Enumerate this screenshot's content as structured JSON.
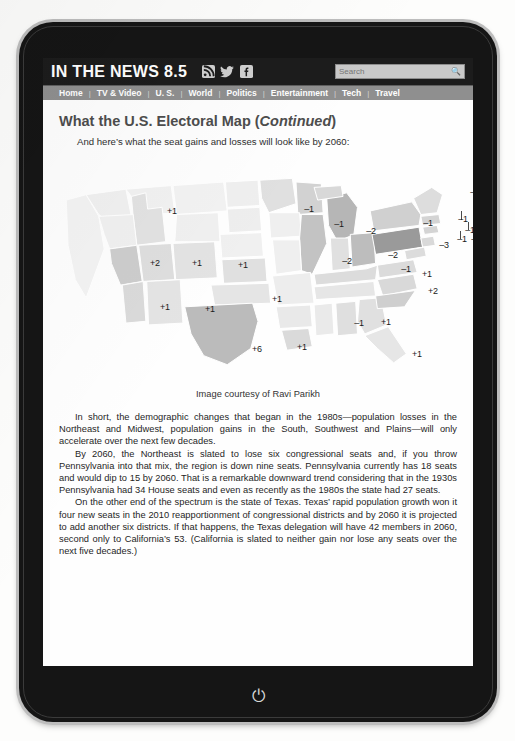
{
  "site": {
    "logo": "IN THE NEWS 8.5",
    "social": [
      {
        "name": "rss-icon",
        "label": "RSS"
      },
      {
        "name": "twitter-icon",
        "label": "Twitter"
      },
      {
        "name": "facebook-icon",
        "label": "Facebook"
      }
    ],
    "search": {
      "placeholder": "Search",
      "value": "",
      "icon": "search-icon"
    },
    "nav": [
      "Home",
      "TV & Video",
      "U. S.",
      "World",
      "Politics",
      "Entertainment",
      "Tech",
      "Travel"
    ],
    "nav_separator": "|"
  },
  "article": {
    "title_main": "What the U.S. Electoral Map (",
    "title_italic": "Continued",
    "title_close": ")",
    "intro": "And here’s what the seat gains and losses will look like by 2060:",
    "caption": "Image courtesy of Ravi Parikh",
    "paragraphs": [
      "In short, the demographic changes that began in the 1980s—population losses in the Northeast and Midwest, population gains in the South, Southwest and Plains—will only accelerate over the next few decades.",
      "By 2060, the Northeast is slated to lose six congressional seats and, if you throw Pennsylvania into that mix, the region is down nine seats. Pennsylvania currently has 18 seats and would dip to 15 by 2060. That is a remarkable downward trend considering that in the 1930s Pennsylvania had 34 House seats and even as recently as the 1980s the state had 27 seats.",
      "On the other end of the spectrum is the state of Texas. Texas’ rapid population growth won it four new seats in the 2010 reapportionment of congressional districts and by 2060 it is projected to add another six districts. If that happens, the Texas delegation will have 42 members in 2060, second only to California’s 53. (California is slated to neither gain nor lose any seats over the next five decades.)"
    ]
  },
  "device": {
    "home_button_icon": "power-icon"
  },
  "chart_data": {
    "type": "map",
    "unit": "congressional seats",
    "colors": {
      "gain_strong": "#b9b9b9",
      "gain_mild": "#d5d5d5",
      "neutral": "#ececec",
      "loss_mild": "#c4c4c4",
      "loss_strong": "#8f8f8f"
    },
    "labels": [
      {
        "state": "Idaho",
        "value": "+1",
        "x": 113,
        "y": 60
      },
      {
        "state": "Nevada",
        "value": "+2",
        "x": 96,
        "y": 112
      },
      {
        "state": "Utah",
        "value": "+1",
        "x": 138,
        "y": 112
      },
      {
        "state": "Colorado",
        "value": "+1",
        "x": 184,
        "y": 114
      },
      {
        "state": "Arizona",
        "value": "+1",
        "x": 106,
        "y": 156
      },
      {
        "state": "New Mexico",
        "value": "+1",
        "x": 151,
        "y": 158
      },
      {
        "state": "Kansas",
        "value": "+1",
        "x": 218,
        "y": 148
      },
      {
        "state": "Texas",
        "value": "+6",
        "x": 198,
        "y": 198
      },
      {
        "state": "Louisiana",
        "value": "+1",
        "x": 243,
        "y": 196
      },
      {
        "state": "Minnesota",
        "value": "-1",
        "x": 250,
        "y": 58
      },
      {
        "state": "Wisconsin",
        "value": "-1",
        "x": 280,
        "y": 73
      },
      {
        "state": "Michigan",
        "value": "-2",
        "x": 312,
        "y": 80
      },
      {
        "state": "Illinois",
        "value": "-2",
        "x": 288,
        "y": 110
      },
      {
        "state": "Ohio",
        "value": "-2",
        "x": 334,
        "y": 104
      },
      {
        "state": "Kentucky",
        "value": "-1",
        "x": 347,
        "y": 118
      },
      {
        "state": "New York",
        "value": "-1",
        "x": 369,
        "y": 72
      },
      {
        "state": "Pennsylvania",
        "value": "-3",
        "x": 385,
        "y": 94
      },
      {
        "state": "Virginia",
        "value": "+1",
        "x": 368,
        "y": 123
      },
      {
        "state": "North Carolina",
        "value": "+2",
        "x": 374,
        "y": 140
      },
      {
        "state": "Maine",
        "value": "-1",
        "x": 416,
        "y": 41
      },
      {
        "state": "Vermont",
        "value": "-1",
        "x": 404,
        "y": 68
      },
      {
        "state": "Massachusetts",
        "value": "-1",
        "x": 411,
        "y": 79
      },
      {
        "state": "Rhode Island",
        "value": "-1",
        "x": 423,
        "y": 79
      },
      {
        "state": "Connecticut",
        "value": "-1",
        "x": 403,
        "y": 88
      },
      {
        "state": "New Jersey",
        "value": "-1",
        "x": 417,
        "y": 88
      },
      {
        "state": "Alabama",
        "value": "-1",
        "x": 300,
        "y": 172
      },
      {
        "state": "Georgia",
        "value": "+1",
        "x": 327,
        "y": 171
      },
      {
        "state": "Florida",
        "value": "+1",
        "x": 358,
        "y": 203
      }
    ]
  }
}
